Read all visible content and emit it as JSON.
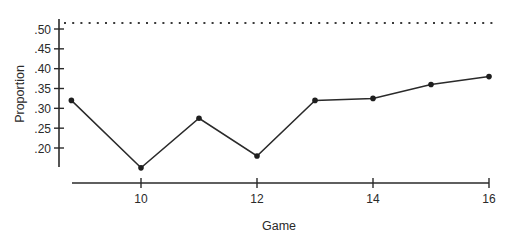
{
  "chart_data": {
    "type": "line",
    "title": "",
    "xlabel": "Game",
    "ylabel": "Proportion",
    "categories": [
      9,
      10,
      11,
      12,
      13,
      14,
      15,
      16
    ],
    "x": [
      8.8,
      10,
      11,
      12,
      13,
      14,
      15,
      16
    ],
    "values": [
      0.32,
      0.15,
      0.275,
      0.18,
      0.32,
      0.325,
      0.36,
      0.38
    ],
    "series": [
      {
        "name": "Proportion",
        "values": [
          0.32,
          0.15,
          0.275,
          0.18,
          0.32,
          0.325,
          0.36,
          0.38
        ]
      }
    ],
    "x_ticks": [
      10,
      12,
      14,
      16
    ],
    "x_tick_labels": [
      "10",
      "12",
      "14",
      "16"
    ],
    "y_ticks": [
      0.2,
      0.25,
      0.3,
      0.35,
      0.4,
      0.45,
      0.5
    ],
    "y_tick_labels": [
      ".20",
      ".25",
      ".30",
      ".35",
      ".40",
      ".45",
      ".50"
    ],
    "xlim": [
      8.8,
      16
    ],
    "ylim": [
      0.15,
      0.525
    ],
    "reference_line": {
      "style": "dotted",
      "y": 0.515
    },
    "grid": false,
    "legend": null
  }
}
